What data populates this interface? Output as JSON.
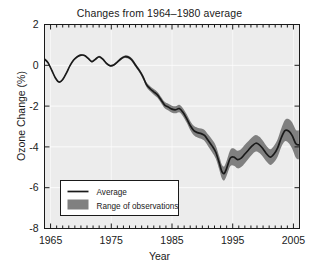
{
  "chart_data": {
    "type": "line",
    "title": "Changes from 1964–1980 average",
    "xlabel": "Year",
    "ylabel": "Ozone Change (%)",
    "xlim": [
      1964,
      2006
    ],
    "ylim": [
      -8,
      2
    ],
    "xticks": [
      1965,
      1975,
      1985,
      1995,
      2005
    ],
    "xtick_labels": [
      "1965",
      "1975",
      "1985",
      "1995",
      "2005"
    ],
    "yticks": [
      2,
      0,
      -2,
      -4,
      -6,
      -8
    ],
    "ytick_labels": [
      "2",
      "0",
      "-2",
      "-4",
      "-6",
      "-8"
    ],
    "x_minor_tick_interval": 1,
    "grid": true,
    "grid_color": "#ffffff",
    "plot_background": "#ececec",
    "legend": {
      "position": "lower-left",
      "entries": [
        {
          "label": "Average",
          "marker": "line",
          "color": "#1a1a1a"
        },
        {
          "label": "Range of observations",
          "marker": "patch",
          "color": "#808080"
        }
      ]
    },
    "series": [
      {
        "name": "Average",
        "color": "#1a1a1a",
        "x": [
          1964.0,
          1964.6,
          1965.2,
          1965.8,
          1966.4,
          1967.0,
          1967.6,
          1968.2,
          1968.8,
          1969.4,
          1970.0,
          1970.6,
          1971.2,
          1971.8,
          1972.4,
          1973.0,
          1973.6,
          1974.2,
          1974.8,
          1975.4,
          1976.0,
          1976.6,
          1977.2,
          1977.8,
          1978.4,
          1979.0,
          1979.6,
          1980.2,
          1980.8,
          1981.4,
          1982.0,
          1982.6,
          1983.2,
          1983.8,
          1984.4,
          1985.0,
          1985.6,
          1986.2,
          1986.8,
          1987.4,
          1988.0,
          1988.6,
          1989.2,
          1989.8,
          1990.4,
          1991.0,
          1991.6,
          1992.2,
          1992.8,
          1993.2,
          1993.6,
          1994.0,
          1994.6,
          1995.2,
          1995.8,
          1996.4,
          1997.0,
          1997.6,
          1998.2,
          1998.8,
          1999.4,
          2000.0,
          2000.6,
          2001.2,
          2001.8,
          2002.4,
          2003.0,
          2003.6,
          2004.2,
          2004.8,
          2005.4,
          2005.9
        ],
        "y": [
          0.3,
          0.12,
          -0.25,
          -0.62,
          -0.82,
          -0.7,
          -0.38,
          -0.02,
          0.26,
          0.42,
          0.5,
          0.48,
          0.34,
          0.18,
          0.3,
          0.42,
          0.3,
          0.1,
          -0.02,
          0.02,
          0.16,
          0.32,
          0.42,
          0.4,
          0.26,
          0.0,
          -0.25,
          -0.55,
          -0.95,
          -1.15,
          -1.3,
          -1.45,
          -1.7,
          -1.95,
          -2.05,
          -2.15,
          -2.18,
          -2.12,
          -2.3,
          -2.6,
          -2.95,
          -3.2,
          -3.3,
          -3.35,
          -3.45,
          -3.7,
          -3.95,
          -4.25,
          -4.8,
          -5.2,
          -5.3,
          -5.05,
          -4.55,
          -4.5,
          -4.62,
          -4.55,
          -4.35,
          -4.15,
          -3.95,
          -3.82,
          -3.9,
          -4.1,
          -4.35,
          -4.5,
          -4.35,
          -4.05,
          -3.55,
          -3.2,
          -3.22,
          -3.45,
          -3.85,
          -3.9
        ]
      }
    ],
    "band": {
      "name": "Range of observations",
      "color": "#808080",
      "half_width_x": [
        1964.0,
        1970.0,
        1976.0,
        1980.0,
        1982.0,
        1984.0,
        1986.0,
        1988.0,
        1990.0,
        1992.0,
        1993.5,
        1995.0,
        1997.0,
        1999.0,
        2001.0,
        2003.0,
        2004.5,
        2005.9
      ],
      "half_width_y": [
        0.04,
        0.04,
        0.05,
        0.1,
        0.14,
        0.16,
        0.18,
        0.22,
        0.26,
        0.32,
        0.34,
        0.42,
        0.45,
        0.4,
        0.38,
        0.45,
        0.62,
        0.72
      ]
    }
  }
}
